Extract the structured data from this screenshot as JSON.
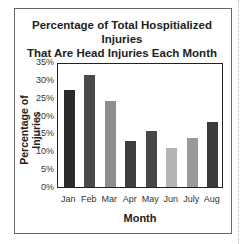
{
  "chart_data": {
    "type": "bar",
    "title": "Percentage of Total Hospitialized Injuries That Are Head Injuries Each Month",
    "title_line1": "Percentage of Total Hospitialized Injuries",
    "title_line2": "That Are Head Injuries Each Month",
    "xlabel": "Month",
    "ylabel": "Percentage of Injuries",
    "categories": [
      "Jan",
      "Feb",
      "Mar",
      "Apr",
      "May",
      "Jun",
      "July",
      "Aug"
    ],
    "values": [
      27.5,
      32,
      24.5,
      13,
      16,
      11,
      14,
      18.5
    ],
    "ylim": [
      0,
      35
    ],
    "yticks": [
      "35%",
      "30%",
      "25%",
      "20%",
      "15%",
      "10%",
      "5%",
      "0%"
    ],
    "bar_colors": [
      "#2b2b2b",
      "#4a4a4a",
      "#8e8e8e",
      "#3e3e3e",
      "#474747",
      "#b4b4b4",
      "#9a9a9a",
      "#3a3a3a"
    ],
    "grid": false,
    "legend": null
  }
}
